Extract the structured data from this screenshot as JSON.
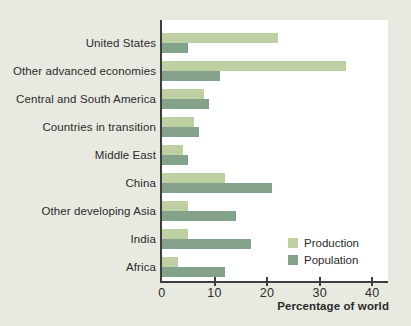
{
  "figure": {
    "background_color": "#e8eae2",
    "plot_background": "#ffffff",
    "axis_color": "#3d3d3d",
    "text_color": "#2a2a2a"
  },
  "chart_data": {
    "type": "bar",
    "orientation": "horizontal",
    "title": "",
    "xlabel": "Percentage of world",
    "ylabel": "",
    "xticks": [
      0,
      10,
      20,
      30,
      40
    ],
    "xlim": [
      0,
      43
    ],
    "grid": false,
    "legend_position": "inside-lower-right",
    "categories": [
      "United States",
      "Other advanced economies",
      "Central and South America",
      "Countries in transition",
      "Middle East",
      "China",
      "Other developing Asia",
      "India",
      "Africa"
    ],
    "series": [
      {
        "name": "Production",
        "color": "#bed0a2",
        "values": [
          22,
          35,
          8,
          6,
          4,
          12,
          5,
          5,
          3
        ]
      },
      {
        "name": "Population",
        "color": "#84a18a",
        "values": [
          5,
          11,
          9,
          7,
          5,
          21,
          14,
          17,
          12
        ]
      }
    ]
  },
  "legend": {
    "items": [
      {
        "label": "Production",
        "color": "#bed0a2"
      },
      {
        "label": "Population",
        "color": "#84a18a"
      }
    ]
  }
}
